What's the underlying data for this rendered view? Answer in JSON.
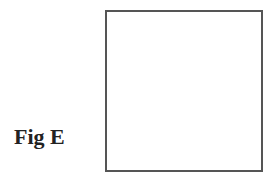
{
  "figure": {
    "label": "Fig E",
    "box": {
      "fill": "#ffffff",
      "border_color": "#555555",
      "content": ""
    }
  }
}
